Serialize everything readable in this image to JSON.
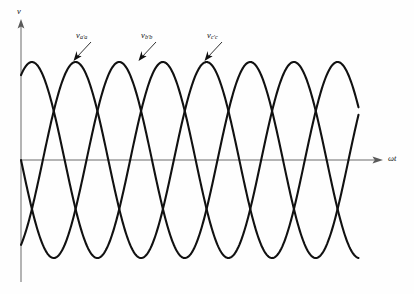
{
  "figure": {
    "background_color": "#fefefe",
    "curve_color": "#111111",
    "axis_color": "#6b6b6b"
  },
  "axes": {
    "y_label": "v",
    "x_label": "ωt",
    "origin_x_px": 21,
    "origin_y_px": 160,
    "y_axis_top_px": 22,
    "y_axis_bottom_px": 282,
    "x_axis_right_px": 382
  },
  "labels": {
    "phase_a": {
      "base": "v",
      "sub": "a'a"
    },
    "phase_b": {
      "base": "v",
      "sub": "b'b"
    },
    "phase_c": {
      "base": "v",
      "sub": "c'c"
    }
  },
  "chart_data": {
    "type": "line",
    "xlabel": "ωt",
    "ylabel": "v",
    "grid": false,
    "legend_position": "inline-annotations",
    "xlim": [
      0,
      940
    ],
    "ylim": [
      -1.15,
      1.15
    ],
    "x_unit": "degrees",
    "amplitude": 1.0,
    "period_degrees": 360,
    "annotations": [
      {
        "text": "v_a'a",
        "points_to_peak_index": 0,
        "label_x_px": 76,
        "label_y_px": 31
      },
      {
        "text": "v_b'b",
        "points_to_peak_index": 1,
        "label_x_px": 141,
        "label_y_px": 31
      },
      {
        "text": "v_c'c",
        "points_to_peak_index": 2,
        "label_x_px": 207,
        "label_y_px": 31
      }
    ],
    "series": [
      {
        "name": "v_a'a",
        "phase_degrees": -60,
        "formula": "sin(ωt - 60°)",
        "start_value": -0.87,
        "x": [
          0,
          30,
          60,
          90,
          120,
          150,
          180,
          210,
          240,
          270,
          300,
          330,
          360,
          390,
          420,
          450,
          480,
          510,
          540,
          570,
          600,
          630,
          660,
          690,
          720,
          750,
          780,
          810,
          840,
          870,
          900,
          930
        ],
        "values": [
          -0.87,
          -0.5,
          0.0,
          0.5,
          0.87,
          1.0,
          0.87,
          0.5,
          0.0,
          -0.5,
          -0.87,
          -1.0,
          -0.87,
          -0.5,
          0.0,
          0.5,
          0.87,
          1.0,
          0.87,
          0.5,
          0.0,
          -0.5,
          -0.87,
          -1.0,
          -0.87,
          -0.5,
          0.0,
          0.5,
          0.87,
          1.0,
          0.87,
          0.5
        ]
      },
      {
        "name": "v_b'b",
        "phase_degrees": 180,
        "formula": "sin(ωt + 180°)",
        "start_value": 0.0,
        "x": [
          0,
          30,
          60,
          90,
          120,
          150,
          180,
          210,
          240,
          270,
          300,
          330,
          360,
          390,
          420,
          450,
          480,
          510,
          540,
          570,
          600,
          630,
          660,
          690,
          720,
          750,
          780,
          810,
          840,
          870,
          900,
          930
        ],
        "values": [
          0.0,
          -0.5,
          -0.87,
          -1.0,
          -0.87,
          -0.5,
          0.0,
          0.5,
          0.87,
          1.0,
          0.87,
          0.5,
          0.0,
          -0.5,
          -0.87,
          -1.0,
          -0.87,
          -0.5,
          0.0,
          0.5,
          0.87,
          1.0,
          0.87,
          0.5,
          0.0,
          -0.5,
          -0.87,
          -1.0,
          -0.87,
          -0.5,
          0.0,
          0.5
        ]
      },
      {
        "name": "v_c'c",
        "phase_degrees": 60,
        "formula": "sin(ωt + 60°)",
        "start_value": 0.87,
        "x": [
          0,
          30,
          60,
          90,
          120,
          150,
          180,
          210,
          240,
          270,
          300,
          330,
          360,
          390,
          420,
          450,
          480,
          510,
          540,
          570,
          600,
          630,
          660,
          690,
          720,
          750,
          780,
          810,
          840,
          870,
          900,
          930
        ],
        "values": [
          0.87,
          1.0,
          0.87,
          0.5,
          0.0,
          -0.5,
          -0.87,
          -1.0,
          -0.87,
          -0.5,
          0.0,
          0.5,
          0.87,
          1.0,
          0.87,
          0.5,
          0.0,
          -0.5,
          -0.87,
          -1.0,
          -0.87,
          -0.5,
          0.0,
          0.5,
          0.87,
          1.0,
          0.87,
          0.5,
          0.0,
          -0.5,
          -0.87,
          -1.0
        ]
      }
    ]
  }
}
